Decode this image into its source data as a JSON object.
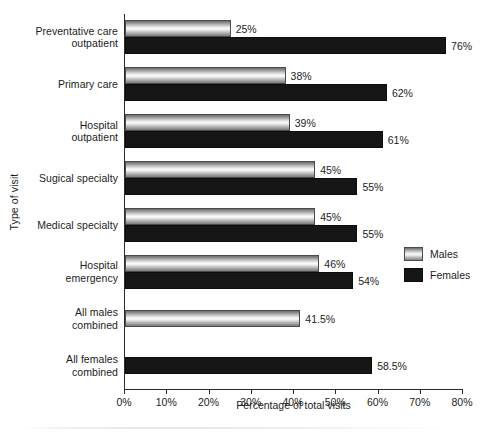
{
  "chart_data": {
    "type": "bar",
    "orientation": "horizontal",
    "title": "",
    "xlabel": "Percentage of total visits",
    "ylabel": "Type of visit",
    "xlim": [
      0,
      80
    ],
    "xticks": [
      "0%",
      "10%",
      "20%",
      "30%",
      "40%",
      "50%",
      "60%",
      "70%",
      "80%"
    ],
    "xtick_values": [
      0,
      10,
      20,
      30,
      40,
      50,
      60,
      70,
      80
    ],
    "grid": false,
    "legend_position": "right",
    "categories": [
      "Preventative care\noutpatient",
      "Primary care",
      "Hospital\noutpatient",
      "Sugical specialty",
      "Medical specialty",
      "Hospital\nemergency",
      "All males\ncombined",
      "All females\ncombined"
    ],
    "series": [
      {
        "name": "Males",
        "color": "#c8c8c8",
        "values": [
          25,
          38,
          39,
          45,
          45,
          46,
          41.5,
          null
        ],
        "labels": [
          "25%",
          "38%",
          "39%",
          "45%",
          "45%",
          "46%",
          "41.5%",
          ""
        ]
      },
      {
        "name": "Females",
        "color": "#161616",
        "values": [
          76,
          62,
          61,
          55,
          55,
          54,
          null,
          58.5
        ],
        "labels": [
          "76%",
          "62%",
          "61%",
          "55%",
          "55%",
          "54%",
          "",
          "58.5%"
        ]
      }
    ],
    "legend": [
      {
        "label": "Males",
        "swatch": "male-gradient"
      },
      {
        "label": "Females",
        "swatch": "female-black"
      }
    ]
  }
}
